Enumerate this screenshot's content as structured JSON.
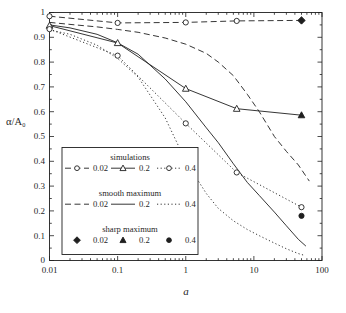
{
  "figure": {
    "background": "#ffffff",
    "ink": "#1f1f1f"
  },
  "chart_data": {
    "type": "line",
    "title": "",
    "xlabel": "a",
    "ylabel": "α/A₀",
    "x_scale": "log",
    "xlim": [
      0.01,
      100
    ],
    "ylim": [
      0,
      1
    ],
    "grid": false,
    "x_ticks": {
      "major": [
        {
          "value": 0.01,
          "label": "0.01"
        },
        {
          "value": 0.1,
          "label": "0.1"
        },
        {
          "value": 1,
          "label": "1"
        },
        {
          "value": 10,
          "label": "10"
        },
        {
          "value": 100,
          "label": "100"
        }
      ],
      "minor": "log-decade-2-to-9"
    },
    "y_ticks": {
      "major_step": 0.1,
      "minor_step": 0.05,
      "labels": [
        "0",
        "0.1",
        "0.2",
        "0.3",
        "0.4",
        "0.5",
        "0.6",
        "0.7",
        "0.8",
        "0.9",
        "1"
      ]
    },
    "series": [
      {
        "name": "simulations-0.02",
        "group": "simulations",
        "param": "0.02",
        "line": "dashed",
        "marker": "circle-open",
        "x": [
          0.01,
          0.1,
          1,
          5.6,
          50
        ],
        "y": [
          0.985,
          0.958,
          0.96,
          0.966,
          0.968
        ],
        "marker_x": [
          0.01,
          0.1,
          1,
          5.6
        ]
      },
      {
        "name": "simulations-0.2",
        "group": "simulations",
        "param": "0.2",
        "line": "solid",
        "marker": "triangle-open",
        "x": [
          0.01,
          0.1,
          1,
          5.6,
          50
        ],
        "y": [
          0.947,
          0.877,
          0.693,
          0.612,
          0.586
        ],
        "marker_x": [
          0.01,
          0.1,
          1,
          5.6
        ]
      },
      {
        "name": "simulations-0.4",
        "group": "simulations",
        "param": "0.4",
        "line": "dotted",
        "marker": "circle-open",
        "x": [
          0.01,
          0.1,
          1,
          5.6,
          50
        ],
        "y": [
          0.933,
          0.826,
          0.553,
          0.355,
          0.215
        ]
      },
      {
        "name": "smooth-maximum-0.02",
        "group": "smooth maximum",
        "param": "0.02",
        "line": "dashed",
        "marker": null,
        "x": [
          0.01,
          0.02,
          0.05,
          0.1,
          0.2,
          0.5,
          1,
          2,
          3,
          5,
          8,
          12,
          20,
          30,
          45,
          65
        ],
        "y": [
          0.96,
          0.952,
          0.942,
          0.932,
          0.92,
          0.897,
          0.872,
          0.835,
          0.8,
          0.745,
          0.67,
          0.6,
          0.5,
          0.44,
          0.385,
          0.32
        ]
      },
      {
        "name": "smooth-maximum-0.2",
        "group": "smooth maximum",
        "param": "0.2",
        "line": "solid",
        "marker": null,
        "x": [
          0.01,
          0.02,
          0.05,
          0.1,
          0.2,
          0.5,
          1,
          2,
          3,
          5,
          8,
          12,
          20,
          30,
          45,
          58
        ],
        "y": [
          0.95,
          0.938,
          0.912,
          0.878,
          0.832,
          0.732,
          0.64,
          0.535,
          0.475,
          0.39,
          0.315,
          0.262,
          0.195,
          0.14,
          0.085,
          0.058
        ]
      },
      {
        "name": "smooth-maximum-0.4",
        "group": "smooth maximum",
        "param": "0.4",
        "line": "dotted",
        "marker": null,
        "x": [
          0.01,
          0.02,
          0.05,
          0.1,
          0.2,
          0.5,
          1,
          2,
          3,
          5,
          8,
          12,
          20,
          30,
          45,
          53
        ],
        "y": [
          0.93,
          0.912,
          0.868,
          0.815,
          0.74,
          0.575,
          0.4,
          0.27,
          0.21,
          0.16,
          0.125,
          0.1,
          0.07,
          0.047,
          0.028,
          0.022
        ]
      },
      {
        "name": "sharp-maximum-0.02",
        "group": "sharp maximum",
        "param": "0.02",
        "line": "none",
        "marker": "diamond-filled",
        "x": [
          50
        ],
        "y": [
          0.968
        ]
      },
      {
        "name": "sharp-maximum-0.2",
        "group": "sharp maximum",
        "param": "0.2",
        "line": "none",
        "marker": "triangle-filled",
        "x": [
          50
        ],
        "y": [
          0.586
        ]
      },
      {
        "name": "sharp-maximum-0.4",
        "group": "sharp maximum",
        "param": "0.4",
        "line": "none",
        "marker": "circle-filled",
        "x": [
          50
        ],
        "y": [
          0.18
        ]
      }
    ],
    "legend": {
      "position": "inside-bottom-left",
      "groups": [
        {
          "title": "simulations",
          "entries": [
            {
              "line": "dashed",
              "marker": "circle-open",
              "label": "0.02"
            },
            {
              "line": "solid",
              "marker": "triangle-open",
              "label": "0.2"
            },
            {
              "line": "dotted",
              "marker": "circle-open",
              "label": "0.4"
            }
          ]
        },
        {
          "title": "smooth maximum",
          "entries": [
            {
              "line": "dashed",
              "marker": null,
              "label": "0.02"
            },
            {
              "line": "solid",
              "marker": null,
              "label": "0.2"
            },
            {
              "line": "dotted",
              "marker": null,
              "label": "0.4"
            }
          ]
        },
        {
          "title": "sharp maximum",
          "entries": [
            {
              "line": "none",
              "marker": "diamond-filled",
              "label": "0.02"
            },
            {
              "line": "none",
              "marker": "triangle-filled",
              "label": "0.2"
            },
            {
              "line": "none",
              "marker": "circle-filled",
              "label": "0.4"
            }
          ]
        }
      ]
    },
    "colors": {
      "ink": "#1f1f1f",
      "background": "#ffffff"
    }
  }
}
